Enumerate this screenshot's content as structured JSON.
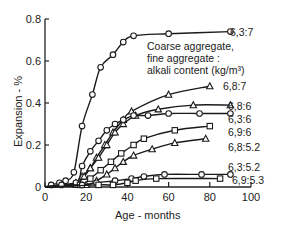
{
  "chart_data": {
    "type": "line",
    "title": "",
    "xlabel": "Age - months",
    "ylabel": "Expansion - %",
    "xlim": [
      0,
      100
    ],
    "ylim": [
      0,
      0.8
    ],
    "xticks": [
      0,
      20,
      40,
      60,
      80,
      100
    ],
    "yticks": [
      0,
      0.2,
      0.4,
      0.6,
      0.8
    ],
    "ytick_labels": [
      "0",
      "0.2",
      "0.4",
      "0.6",
      "0.8"
    ],
    "grid": false,
    "legend_title": [
      "Coarse aggregate,",
      "fine aggregate :",
      "alkali content (kg/m³)"
    ],
    "series": [
      {
        "name": "6,3:7",
        "marker": "circle",
        "x": [
          0,
          3,
          7,
          10,
          14,
          18,
          23,
          27,
          33,
          38,
          43,
          60,
          90
        ],
        "y": [
          0,
          0.01,
          0.02,
          0.03,
          0.07,
          0.29,
          0.44,
          0.57,
          0.63,
          0.69,
          0.72,
          0.73,
          0.74
        ]
      },
      {
        "name": "6,8:7",
        "marker": "triangle",
        "x": [
          0,
          15,
          18,
          22,
          25,
          29,
          33,
          38,
          42,
          60,
          80
        ],
        "y": [
          0,
          0.01,
          0.05,
          0.09,
          0.14,
          0.2,
          0.26,
          0.32,
          0.36,
          0.44,
          0.48
        ]
      },
      {
        "name": "6,8:6",
        "marker": "triangle",
        "x": [
          0,
          15,
          19,
          22,
          26,
          30,
          34,
          38,
          44,
          55,
          72,
          90
        ],
        "y": [
          0,
          0.02,
          0.05,
          0.09,
          0.14,
          0.2,
          0.26,
          0.3,
          0.34,
          0.37,
          0.39,
          0.39
        ]
      },
      {
        "name": "6,3:6",
        "marker": "circle",
        "x": [
          0,
          15,
          18,
          22,
          26,
          30,
          34,
          38,
          43,
          50,
          60,
          75,
          90
        ],
        "y": [
          0,
          0.02,
          0.1,
          0.17,
          0.22,
          0.27,
          0.3,
          0.32,
          0.34,
          0.34,
          0.35,
          0.35,
          0.35
        ]
      },
      {
        "name": "6,9:6",
        "marker": "square",
        "x": [
          0,
          17,
          22,
          27,
          32,
          37,
          43,
          48,
          63,
          80
        ],
        "y": [
          0,
          0.01,
          0.04,
          0.08,
          0.12,
          0.16,
          0.2,
          0.23,
          0.27,
          0.29
        ]
      },
      {
        "name": "6,8:5.2",
        "marker": "triangle",
        "x": [
          0,
          20,
          25,
          30,
          34,
          38,
          43,
          52,
          63,
          78
        ],
        "y": [
          0,
          0.01,
          0.03,
          0.06,
          0.09,
          0.12,
          0.15,
          0.18,
          0.21,
          0.23
        ]
      },
      {
        "name": "6,3:5.2",
        "marker": "circle",
        "x": [
          0,
          8,
          18,
          25,
          34,
          42,
          48,
          58,
          76,
          90
        ],
        "y": [
          0,
          0.01,
          0.01,
          0.02,
          0.03,
          0.04,
          0.05,
          0.06,
          0.06,
          0.06
        ]
      },
      {
        "name": "6,9:5.3",
        "marker": "square",
        "x": [
          0,
          26,
          33,
          40,
          44,
          54,
          85
        ],
        "y": [
          0,
          0.01,
          0.01,
          0.02,
          0.03,
          0.04,
          0.04
        ]
      }
    ]
  }
}
